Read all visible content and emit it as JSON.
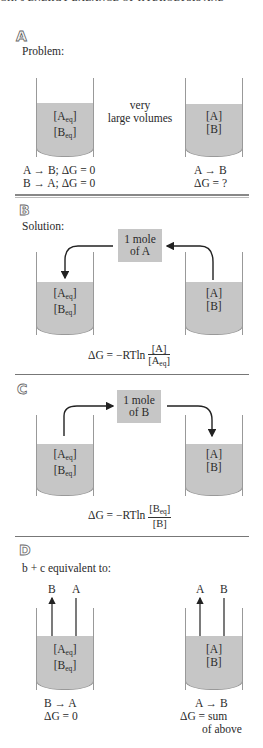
{
  "header": {
    "running_title": "CH. 6   ENERGY BALANCE OF HYDROLYSIS AND"
  },
  "panels": {
    "a": {
      "letter": "A",
      "title": "Problem:",
      "left_beaker": {
        "line1": "[A",
        "line1_sub": "eq",
        "line2": "[B",
        "line2_sub": "eq"
      },
      "middle_text_1": "very",
      "middle_text_2": "large volumes",
      "right_beaker": {
        "line1": "[A]",
        "line2": "[B]"
      },
      "left_eq_1": "A → B; ΔG = 0",
      "left_eq_2": "B → A; ΔG = 0",
      "right_eq_1": "A → B",
      "right_eq_2": "ΔG = ?"
    },
    "b": {
      "letter": "B",
      "title": "Solution:",
      "box_line1": "1 mole",
      "box_line2": "of A",
      "left_beaker": {
        "line1": "[A",
        "line1_sub": "eq",
        "line2": "[B",
        "line2_sub": "eq"
      },
      "right_beaker": {
        "line1": "[A]",
        "line2": "[B]"
      },
      "formula_prefix": "ΔG = −RTln",
      "formula_num": "[A]",
      "formula_den": "[A",
      "formula_den_sub": "eq"
    },
    "c": {
      "letter": "C",
      "box_line1": "1 mole",
      "box_line2": "of B",
      "left_beaker": {
        "line1": "[A",
        "line1_sub": "eq",
        "line2": "[B",
        "line2_sub": "eq"
      },
      "right_beaker": {
        "line1": "[A]",
        "line2": "[B]"
      },
      "formula_prefix": "ΔG = −RTln",
      "formula_num": "[B",
      "formula_num_sub": "eq",
      "formula_den": "[B]"
    },
    "d": {
      "letter": "D",
      "title": "b + c equivalent to:",
      "left_arrow_labels": [
        "B",
        "A"
      ],
      "right_arrow_labels": [
        "A",
        "B"
      ],
      "left_beaker": {
        "line1": "[A",
        "line1_sub": "eq",
        "line2": "[B",
        "line2_sub": "eq"
      },
      "right_beaker": {
        "line1": "[A]",
        "line2": "[B]"
      },
      "left_eq_1": "B → A",
      "left_eq_2": "ΔG = 0",
      "right_eq_1": "A → B",
      "right_eq_2": "ΔG = sum",
      "right_eq_3": "of above"
    }
  },
  "colors": {
    "liquid": "#c6c6c6",
    "box": "#c6c6c6",
    "line": "#333333",
    "separator": "#777777"
  }
}
